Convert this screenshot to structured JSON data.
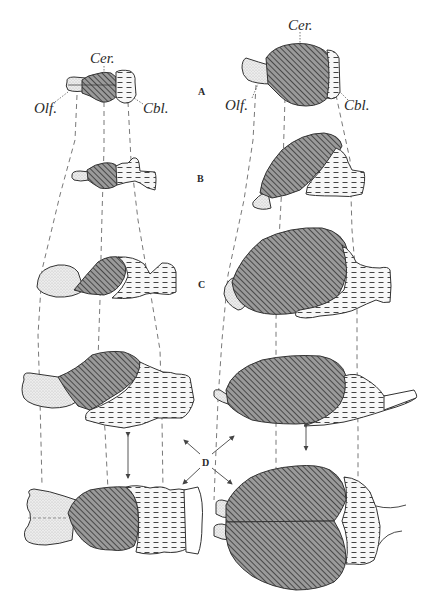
{
  "figure": {
    "type": "comparative brain anatomy diagram",
    "row_labels": [
      "A",
      "B",
      "C",
      "D"
    ],
    "region_labels": {
      "cerebrum": "Cer.",
      "olfactory": "Olf.",
      "cerebellum": "Cbl."
    },
    "legend_patterns": {
      "olfactory": "stippled",
      "cerebrum": "diagonal hatching",
      "cerebellum": "horizontal dashes"
    },
    "columns": [
      "left series (smaller brains)",
      "right series (larger brains)"
    ],
    "colors": {
      "ink": "#333333",
      "cerebrum_fill": "#8c8c8c",
      "olfactory_fill": "#e6e6e6",
      "cerebellum_fill": "#f5f5f5",
      "paper": "#ffffff"
    }
  }
}
